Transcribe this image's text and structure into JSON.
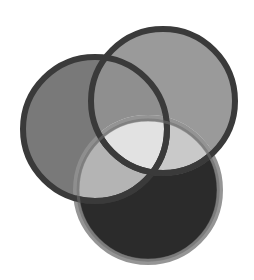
{
  "figure": {
    "caption": "regions in a Live Paint group",
    "caption_color": "#6e6e6e",
    "background": "#ffffff",
    "width": 254,
    "height": 280
  },
  "chart_data": {
    "type": "diagram",
    "subtype": "three-circle-venn",
    "title": "regions in a Live Paint group",
    "xlabel": "",
    "ylabel": "",
    "legend": "none",
    "grid": false,
    "circles": [
      {
        "id": "left-circle",
        "label": "left circle",
        "cx": 95,
        "cy": 129,
        "r": 72,
        "fill": "#797979",
        "stroke": "#3a3a3a",
        "stroke_width": 6
      },
      {
        "id": "top-right-circle",
        "label": "top right circle",
        "cx": 163,
        "cy": 101,
        "r": 72,
        "fill": "#9a9a9a",
        "stroke": "#3a3a3a",
        "stroke_width": 6
      },
      {
        "id": "bottom-circle",
        "label": "bottom circle",
        "cx": 148,
        "cy": 190,
        "r": 72,
        "fill": "#2b2b2b",
        "stroke": "#8f8f8f",
        "stroke_width": 6
      }
    ],
    "regions": [
      {
        "id": "region-left-only",
        "label": "left only",
        "fill": "#797979"
      },
      {
        "id": "region-topright-only",
        "label": "top right only",
        "fill": "#9a9a9a"
      },
      {
        "id": "region-bottom-only",
        "label": "bottom only",
        "fill": "#2b2b2b"
      },
      {
        "id": "region-left-topright",
        "label": "left and top right",
        "fill": "#8f8f8f"
      },
      {
        "id": "region-left-bottom",
        "label": "left and bottom",
        "fill": "#b4b4b4"
      },
      {
        "id": "region-topright-bottom",
        "label": "top right and bottom",
        "fill": "#c9c9c9"
      },
      {
        "id": "region-center",
        "label": "all three",
        "fill": "#e2e2e2"
      }
    ],
    "highlight_arcs": [
      {
        "id": "arc-left-topright",
        "color": "#ededed"
      },
      {
        "id": "arc-topright-bottom",
        "color": "#d8d8d8"
      }
    ],
    "colors": {
      "outline_dark": "#3a3a3a",
      "outline_soft": "#8f8f8f",
      "center": "#e2e2e2",
      "background": "#ffffff"
    }
  }
}
